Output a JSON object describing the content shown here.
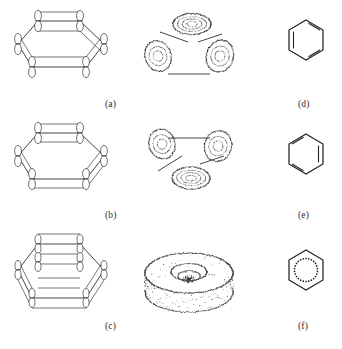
{
  "figure": {
    "kind": "scientific-figure",
    "background_color": "#ffffff",
    "ink_color": "#2a2a2a",
    "panels": [
      {
        "id": "a",
        "caption": "(a)",
        "row": 1,
        "column": "left",
        "type": "wireframe-p-orbital-ring",
        "description": "Hexagonal ring drawn in perspective with vertical p-orbital dumbbell lobes at each of the six vertices, connected by straight bonds"
      },
      {
        "id": "b",
        "caption": "(b)",
        "row": 2,
        "column": "left",
        "type": "wireframe-p-orbital-ring",
        "description": "Hexagonal ring in perspective with p-orbital lobes, phases arranged differently from panel (a)"
      },
      {
        "id": "c",
        "caption": "(c)",
        "row": 3,
        "column": "left",
        "type": "wireframe-p-orbital-ring",
        "description": "Hexagonal ring in perspective with a denser mesh of p-orbital lobes and bonds, all lobes in phase"
      },
      {
        "id": "d",
        "caption": "(d)",
        "row": 1,
        "column": "right",
        "type": "kekule-hexagon",
        "description": "Benzene Kekule structure, first resonance form with three alternating double bonds"
      },
      {
        "id": "e",
        "caption": "(e)",
        "row": 2,
        "column": "right",
        "type": "kekule-hexagon",
        "description": "Benzene Kekule structure, second resonance form with double bonds on the complementary edges"
      },
      {
        "id": "f",
        "caption": "(f)",
        "row": 3,
        "column": "right",
        "type": "aromatic-hexagon",
        "description": "Benzene drawn as a hexagon enclosing a dotted circle denoting the delocalised aromatic sextet"
      }
    ],
    "middle_column": [
      {
        "row": 1,
        "type": "dotted-isosurface",
        "description": "Three dotted lobe blobs above and below the ring plane, joined by straight connector lines"
      },
      {
        "row": 2,
        "type": "dotted-isosurface",
        "description": "Inverted arrangement of three dotted lobe blobs joined by straight connector lines"
      },
      {
        "row": 3,
        "type": "dotted-isosurface-torus",
        "description": "Continuous dotted torus, a doughnut shaped isosurface representing the fully delocalised pi system"
      }
    ],
    "captions": {
      "a": "(a)",
      "b": "(b)",
      "c": "(c)",
      "d": "(d)",
      "e": "(e)",
      "f": "(f)"
    }
  }
}
